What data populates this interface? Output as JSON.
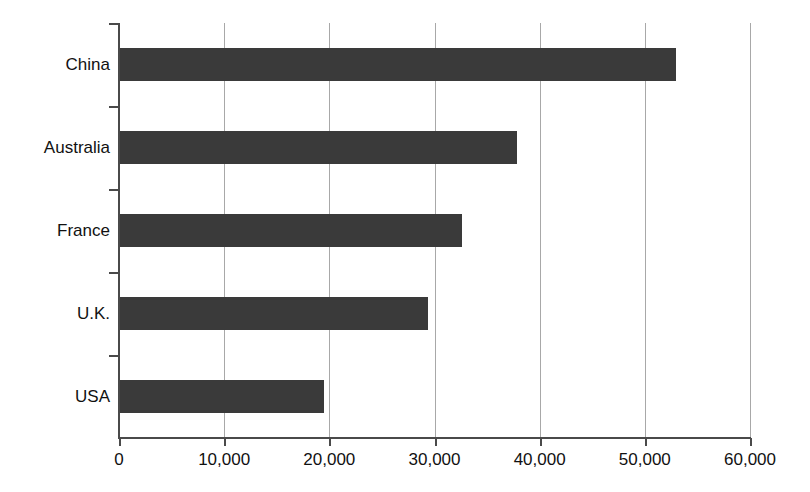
{
  "chart_data": {
    "type": "bar",
    "orientation": "horizontal",
    "title": "",
    "xlabel": "",
    "ylabel": "",
    "categories": [
      "China",
      "Australia",
      "France",
      "U.K.",
      "USA"
    ],
    "values": [
      53000,
      37800,
      32600,
      29400,
      19500
    ],
    "series": [
      {
        "name": "",
        "values": [
          53000,
          37800,
          32600,
          29400,
          19500
        ]
      }
    ],
    "xlim": [
      0,
      60000
    ],
    "xticks": [
      0,
      10000,
      20000,
      30000,
      40000,
      50000,
      60000
    ],
    "xtick_labels": [
      "0",
      "10,000",
      "20,000",
      "30,000",
      "40,000",
      "50,000",
      "60,000"
    ],
    "grid": true,
    "grid_axis": "x",
    "legend": false,
    "legend_position": "none",
    "bar_color": "#3a3a3a",
    "grid_color": "#a8a8a8",
    "axis_color": "#4a4a4a",
    "background_color": "#ffffff"
  }
}
